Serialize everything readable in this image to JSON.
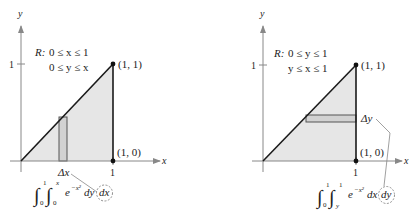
{
  "diagrams": [
    {
      "id": "left",
      "axis_labels": {
        "x": "x",
        "y": "y"
      },
      "tick_labels": {
        "x_one": "1",
        "y_one": "1"
      },
      "region": {
        "label": "R:",
        "line1": "0 ≤ x ≤ 1",
        "line2": "0 ≤ y ≤ x"
      },
      "points": [
        {
          "label": "(1, 1)"
        },
        {
          "label": "(1, 0)"
        }
      ],
      "strip_label": "Δx",
      "integral": {
        "outer_upper": "1",
        "outer_lower": "0",
        "inner_upper": "x",
        "inner_lower": "0",
        "integrand_base": "e",
        "integrand_exp": "−x²",
        "inner_diff": "dy",
        "outer_diff": "dx"
      }
    },
    {
      "id": "right",
      "axis_labels": {
        "x": "x",
        "y": "y"
      },
      "tick_labels": {
        "x_one": "1",
        "y_one": "1"
      },
      "region": {
        "label": "R:",
        "line1": "0 ≤ y ≤ 1",
        "line2": "y ≤ x ≤ 1"
      },
      "points": [
        {
          "label": "(1, 1)"
        },
        {
          "label": "(1, 0)"
        }
      ],
      "strip_label": "Δy",
      "integral": {
        "outer_upper": "1",
        "outer_lower": "0",
        "inner_upper": "1",
        "inner_lower": "y",
        "integrand_base": "e",
        "integrand_exp": "−x²",
        "inner_diff": "dx",
        "outer_diff": "dy"
      }
    }
  ],
  "colors": {
    "region_fill": "#e6e6e6",
    "strip_fill": "#d2d2d2",
    "axis": "#888888",
    "line": "#1a1a1a"
  }
}
